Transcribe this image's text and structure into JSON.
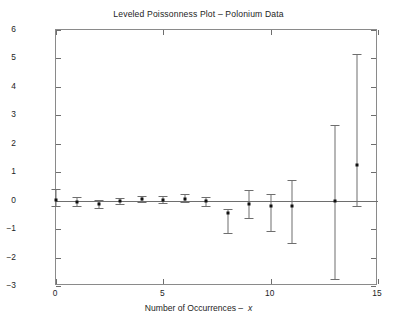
{
  "chart_data": {
    "type": "scatter",
    "title": "Leveled Poissonness Plot – Polonium Data",
    "xlabel": "Number of Occurrences –  x",
    "ylabel": "φ ( n*x ) + λ0 – x log(λ0 )",
    "xlim": [
      0,
      15
    ],
    "ylim": [
      -3,
      6
    ],
    "xticks": [
      0,
      5,
      10,
      15
    ],
    "yticks": [
      -3,
      -2,
      -1,
      0,
      1,
      2,
      3,
      4,
      5,
      6
    ],
    "xticklabels": [
      "0",
      "5",
      "10",
      "15"
    ],
    "yticklabels": [
      "-3",
      "-2",
      "-1",
      "0",
      "1",
      "2",
      "3",
      "4",
      "5",
      "6"
    ],
    "grid": false,
    "legend": null,
    "reference_line": {
      "y": 0,
      "style": "solid"
    },
    "error_bars": true,
    "x": [
      0,
      1,
      2,
      3,
      4,
      5,
      6,
      7,
      8,
      9,
      10,
      11,
      13,
      14
    ],
    "values": [
      0.02,
      -0.03,
      -0.1,
      0.0,
      0.05,
      0.02,
      0.05,
      -0.02,
      -0.42,
      -0.1,
      -0.18,
      -0.17,
      0.0,
      1.25
    ],
    "lower": [
      -0.2,
      -0.2,
      -0.25,
      -0.1,
      -0.05,
      -0.08,
      -0.05,
      -0.18,
      -1.15,
      -0.62,
      -1.05,
      -1.48,
      -2.75,
      -0.18
    ],
    "upper": [
      0.42,
      0.12,
      0.02,
      0.1,
      0.18,
      0.15,
      0.22,
      0.12,
      -0.28,
      0.38,
      0.25,
      0.72,
      2.65,
      5.15
    ]
  }
}
